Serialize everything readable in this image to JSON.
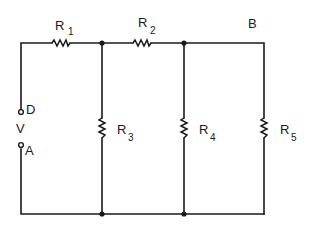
{
  "diagram": {
    "type": "circuit-schematic",
    "colors": {
      "line": "#1a1a1a",
      "background": "#ffffff"
    },
    "labels": {
      "r1": {
        "main": "R",
        "sub": "1"
      },
      "r2": {
        "main": "R",
        "sub": "2"
      },
      "r3": {
        "main": "R",
        "sub": "3"
      },
      "r4": {
        "main": "R",
        "sub": "4"
      },
      "r5": {
        "main": "R",
        "sub": "5"
      },
      "node_b": "B",
      "terminal_d": "D",
      "terminal_a": "A",
      "source_v": "V"
    },
    "components": [
      {
        "id": "R1",
        "kind": "resistor",
        "orientation": "horizontal",
        "branch": "top-left series"
      },
      {
        "id": "R2",
        "kind": "resistor",
        "orientation": "horizontal",
        "branch": "top-middle series"
      },
      {
        "id": "R3",
        "kind": "resistor",
        "orientation": "vertical",
        "branch": "shunt after R1"
      },
      {
        "id": "R4",
        "kind": "resistor",
        "orientation": "vertical",
        "branch": "shunt after R2"
      },
      {
        "id": "R5",
        "kind": "resistor",
        "orientation": "vertical",
        "branch": "rightmost shunt"
      }
    ],
    "terminals": [
      {
        "id": "D",
        "position": "left side upper"
      },
      {
        "id": "A",
        "position": "left side lower"
      }
    ],
    "junctions": 4
  }
}
